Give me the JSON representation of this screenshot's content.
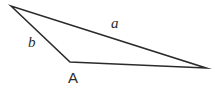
{
  "figure": {
    "kind": "geometry-diagram",
    "shape": "triangle",
    "background_color": "#ffffff",
    "stroke_color": "#2b2b2b",
    "stroke_width": 1.6,
    "fill": "none",
    "width": 215,
    "height": 94
  },
  "labels": {
    "side_a": "a",
    "side_b": "b",
    "vertex_A": "A"
  },
  "chart_data": {
    "type": "diagram",
    "title": "",
    "shape": "triangle",
    "vertices": [
      {
        "name": "apex",
        "x": 11,
        "y": 6
      },
      {
        "name": "A",
        "x": 70,
        "y": 62
      },
      {
        "name": "right",
        "x": 206,
        "y": 68
      }
    ],
    "edges": [
      {
        "name": "a",
        "from": "apex",
        "to": "right",
        "label": "a"
      },
      {
        "name": "b",
        "from": "apex",
        "to": "A",
        "label": "b"
      },
      {
        "name": "base",
        "from": "A",
        "to": "right",
        "label": ""
      }
    ],
    "annotations": [
      {
        "text": "a",
        "x": 116,
        "y": 24,
        "style": "italic"
      },
      {
        "text": "b",
        "x": 33,
        "y": 43,
        "style": "italic"
      },
      {
        "text": "A",
        "x": 74,
        "y": 78,
        "style": "upright"
      }
    ],
    "grid": false,
    "legend": null
  }
}
